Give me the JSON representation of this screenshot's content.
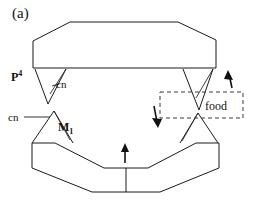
{
  "figure": {
    "panel_label": "(a)",
    "caption_alt": "Schematic of upper and lower jaw occlusion with food between carnassial teeth",
    "colors": {
      "stroke": "#1b1b1b",
      "dashed": "#3a3a3a",
      "arrow": "#111111",
      "background": "#ffffff"
    }
  },
  "labels": {
    "panel": "(a)",
    "upper_premolar": "P",
    "upper_premolar_superscript": "4",
    "cusp_upper": "cn",
    "cusp_lower": "cn",
    "lower_molar": "M",
    "lower_molar_subscript": "1",
    "food": "food"
  },
  "icons": {
    "arrow_up_right": "arrow-up-icon",
    "arrow_down_left": "arrow-down-icon",
    "arrow_up_center": "arrow-up-icon"
  },
  "shapes": {
    "upper_jaw": {
      "name": "upper-jaw-polygon",
      "points": "33,41 68,22 176,22 216,24 216,41 216,68 33,68"
    },
    "lower_jaw": {
      "name": "lower-jaw-polygon",
      "points": "34,143 34,168 92,192 160,192 218,168 218,143"
    },
    "upper_left_tooth": {
      "name": "upper-left-premolar",
      "points": "36,69 66,69 48,105"
    },
    "upper_right_tooth": {
      "name": "upper-right-premolar",
      "points": "183,69 213,69 199,110"
    },
    "lower_left_tooth": {
      "name": "lower-left-molar",
      "points": "32,143 54,111 73,143"
    },
    "lower_right_tooth": {
      "name": "lower-right-molar",
      "points": "180,143 198,113 218,143"
    },
    "food_box": {
      "name": "food-dashed-box",
      "x": 160,
      "y": 92,
      "width": 83,
      "height": 26
    }
  }
}
